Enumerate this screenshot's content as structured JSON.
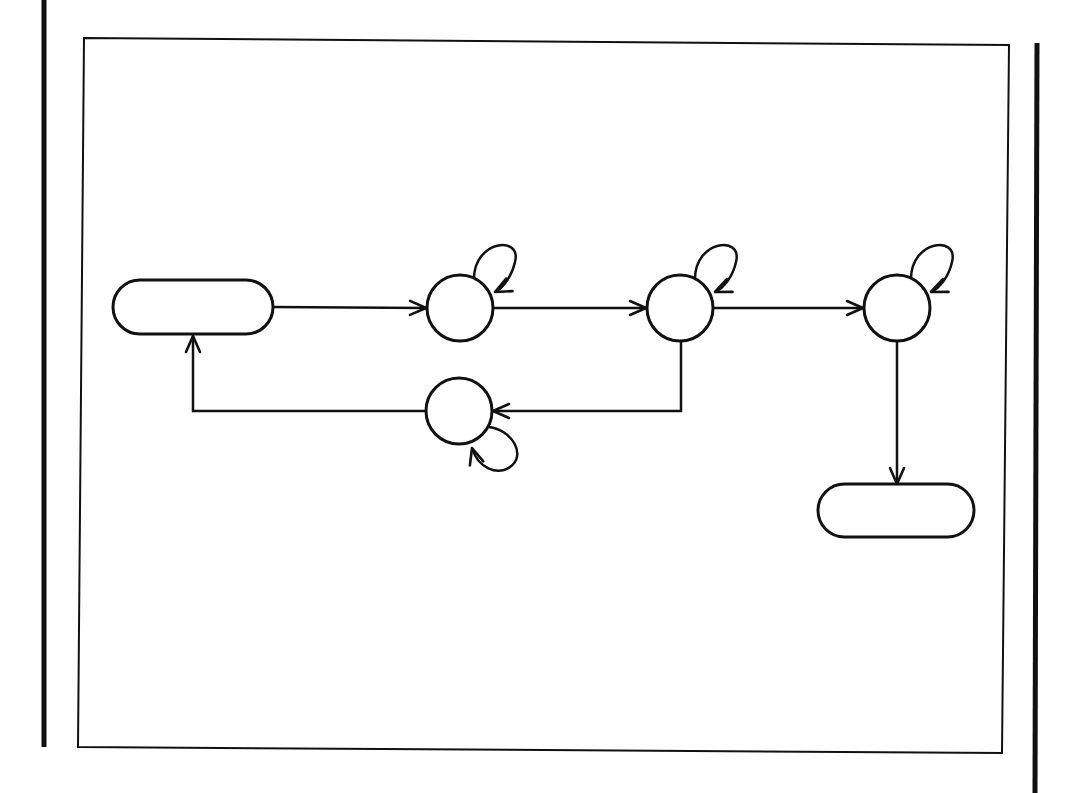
{
  "diagram": {
    "type": "state-transition-diagram",
    "colors": {
      "stroke": "#111111",
      "background": "#ffffff"
    },
    "page_bars": [
      {
        "id": "left-bar",
        "x": 44,
        "y1": 0,
        "y2": 747
      },
      {
        "id": "right-bar",
        "x": 1037,
        "y1": 43,
        "y2": 793
      }
    ],
    "frame": {
      "x": 78,
      "y": 38,
      "width": 928,
      "height": 713
    },
    "nodes": [
      {
        "id": "start-terminal",
        "shape": "terminal",
        "label": "",
        "x": 113,
        "y": 280,
        "width": 160,
        "height": 54
      },
      {
        "id": "state-1",
        "shape": "circle",
        "label": "",
        "cx": 460,
        "cy": 308,
        "r": 33,
        "self_loop": "top-right"
      },
      {
        "id": "state-2",
        "shape": "circle",
        "label": "",
        "cx": 680,
        "cy": 308,
        "r": 33,
        "self_loop": "top-right"
      },
      {
        "id": "state-3",
        "shape": "circle",
        "label": "",
        "cx": 897,
        "cy": 308,
        "r": 33,
        "self_loop": "top-right"
      },
      {
        "id": "state-4",
        "shape": "circle",
        "label": "",
        "cx": 459,
        "cy": 411,
        "r": 33,
        "self_loop": "bottom-right"
      },
      {
        "id": "end-terminal",
        "shape": "terminal",
        "label": "",
        "x": 818,
        "y": 484,
        "width": 156,
        "height": 53
      }
    ],
    "edges": [
      {
        "from": "start-terminal",
        "to": "state-1"
      },
      {
        "from": "state-1",
        "to": "state-2"
      },
      {
        "from": "state-2",
        "to": "state-3"
      },
      {
        "from": "state-2",
        "to": "state-4"
      },
      {
        "from": "state-4",
        "to": "start-terminal"
      },
      {
        "from": "state-3",
        "to": "end-terminal"
      },
      {
        "from": "state-1",
        "to": "state-1"
      },
      {
        "from": "state-2",
        "to": "state-2"
      },
      {
        "from": "state-3",
        "to": "state-3"
      },
      {
        "from": "state-4",
        "to": "state-4"
      }
    ]
  }
}
